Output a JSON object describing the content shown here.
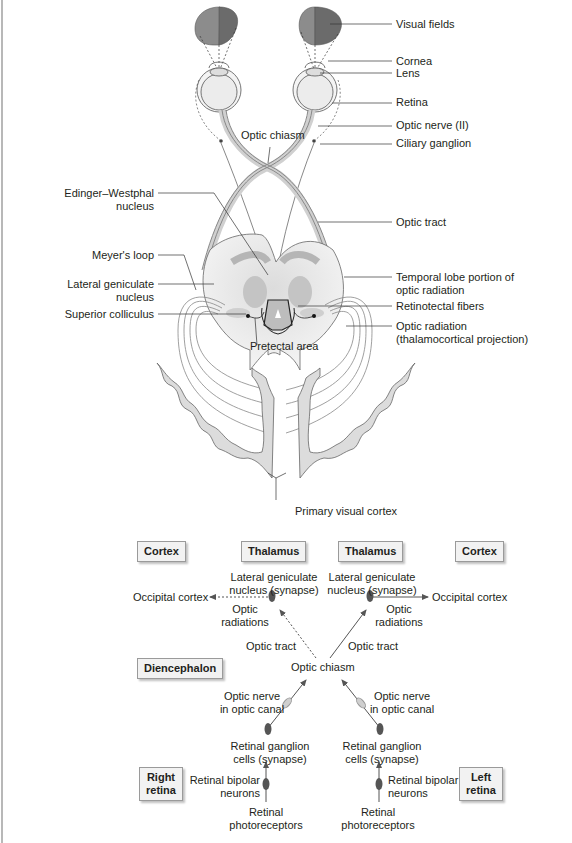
{
  "colors": {
    "visual_field_light": "#8c8c8c",
    "visual_field_dark": "#6b6b6b",
    "brain_fill": "#e6e6e6",
    "brain_inner": "#c9c9c9",
    "line": "#555555",
    "box_bg": "#f2f2f2"
  },
  "anatomy_labels": {
    "visual_fields": "Visual fields",
    "cornea": "Cornea",
    "lens": "Lens",
    "retina": "Retina",
    "optic_nerve": "Optic nerve (II)",
    "ciliary_ganglion": "Ciliary ganglion",
    "optic_chiasm": "Optic chiasm",
    "edinger_westphal_1": "Edinger–Westphal",
    "edinger_westphal_2": "nucleus",
    "optic_tract": "Optic tract",
    "meyers_loop": "Meyer's loop",
    "lgn_1": "Lateral geniculate",
    "lgn_2": "nucleus",
    "superior_colliculus": "Superior colliculus",
    "temporal_lobe_1": "Temporal lobe portion of",
    "temporal_lobe_2": "optic radiation",
    "retinotectal": "Retinotectal fibers",
    "optic_radiation_1": "Optic radiation",
    "optic_radiation_2": "(thalamocortical projection)",
    "pretectal_area": "Pretectal area",
    "primary_visual_cortex": "Primary visual cortex"
  },
  "flowchart": {
    "boxes": {
      "cortex_left": "Cortex",
      "thalamus_left": "Thalamus",
      "thalamus_right": "Thalamus",
      "cortex_right": "Cortex",
      "diencephalon": "Diencephalon",
      "right_retina_1": "Right",
      "right_retina_2": "retina",
      "left_retina_1": "Left",
      "left_retina_2": "retina"
    },
    "left_path": {
      "lgn_1": "Lateral geniculate",
      "lgn_2": "nucleus (synapse)",
      "occipital": "Occipital cortex",
      "radiations_1": "Optic",
      "radiations_2": "radiations",
      "optic_tract": "Optic tract",
      "optic_nerve_1": "Optic nerve",
      "optic_nerve_2": "in optic canal",
      "ganglion_1": "Retinal ganglion",
      "ganglion_2": "cells (synapse)",
      "bipolar_1": "Retinal bipolar",
      "bipolar_2": "neurons",
      "photo_1": "Retinal",
      "photo_2": "photoreceptors"
    },
    "right_path": {
      "lgn_1": "Lateral geniculate",
      "lgn_2": "nucleus (synapse)",
      "occipital": "Occipital cortex",
      "radiations_1": "Optic",
      "radiations_2": "radiations",
      "optic_tract": "Optic tract",
      "optic_nerve_1": "Optic nerve",
      "optic_nerve_2": "in optic canal",
      "ganglion_1": "Retinal ganglion",
      "ganglion_2": "cells (synapse)",
      "bipolar_1": "Retinal bipolar",
      "bipolar_2": "neurons",
      "photo_1": "Retinal",
      "photo_2": "photoreceptors"
    },
    "optic_chiasm": "Optic chiasm"
  }
}
